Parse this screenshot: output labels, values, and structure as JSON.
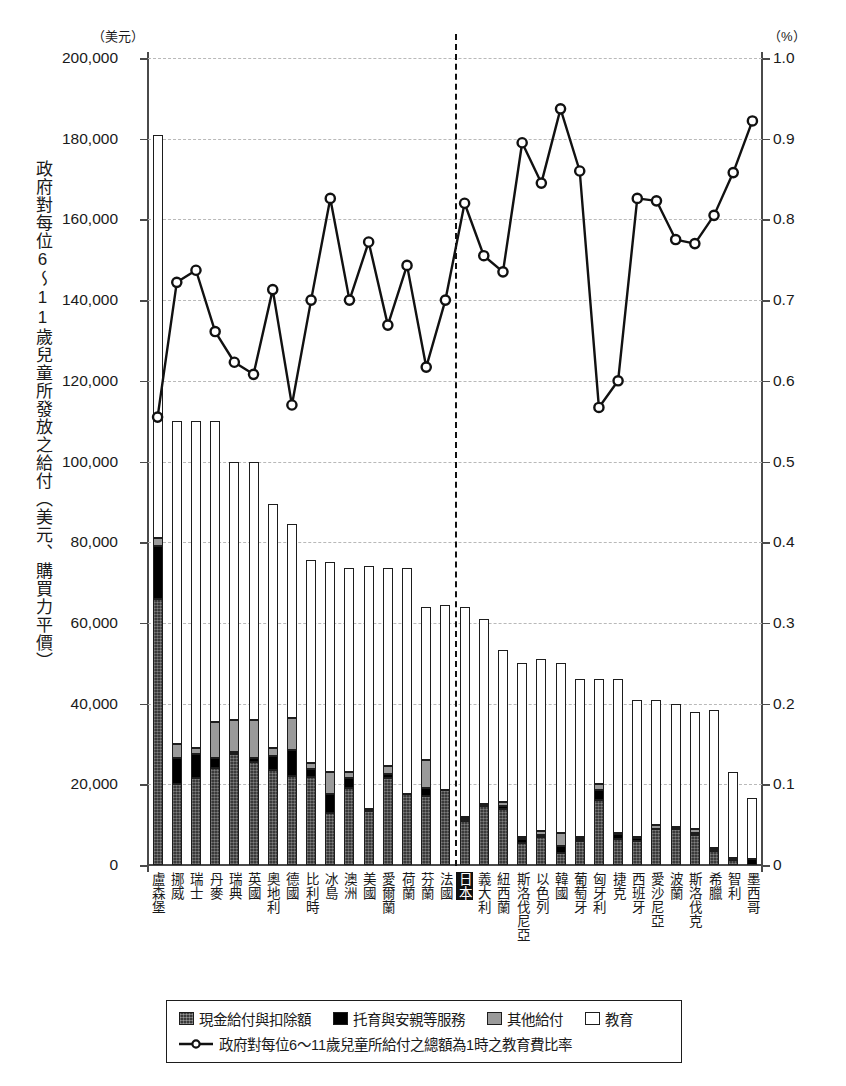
{
  "axes": {
    "left_unit": "（美元）",
    "right_unit": "（%）",
    "y_title": "政府對每位6〜11歲兒童所發放之給付（美元、購買力平價）",
    "left_ticks": [
      "200,000",
      "180,000",
      "160,000",
      "140,000",
      "120,000",
      "100,000",
      "80,000",
      "60,000",
      "40,000",
      "20,000",
      "0"
    ],
    "right_ticks": [
      "1.0",
      "0.9",
      "0.8",
      "0.7",
      "0.6",
      "0.5",
      "0.4",
      "0.3",
      "0.2",
      "0.1",
      "0"
    ]
  },
  "legend": {
    "items": [
      {
        "key": "cash",
        "label": "現金給付與扣除額",
        "color": "#3a3a3a"
      },
      {
        "key": "childcare",
        "label": "托育與安親等服務",
        "color": "#000000"
      },
      {
        "key": "other",
        "label": "其他給付",
        "color": "#9a9a9a"
      },
      {
        "key": "education",
        "label": "教育",
        "color": "#ffffff"
      }
    ],
    "line_label": "政府對每位6〜11歲兒童所給付之總額為1時之教育費比率"
  },
  "highlight_country": "日本",
  "chart_data": {
    "type": "bar",
    "title": "",
    "subtitle": "",
    "xlabel": "",
    "ylabel": "政府對每位6〜11歲兒童所發放之給付（美元、購買力平價）",
    "y2label": "（%）",
    "ylim": [
      0,
      200000
    ],
    "y2lim": [
      0,
      1.0
    ],
    "grid": true,
    "legend_position": "bottom",
    "stacked": true,
    "categories": [
      "盧森堡",
      "挪威",
      "瑞士",
      "丹麥",
      "瑞典",
      "英國",
      "奧地利",
      "德國",
      "比利時",
      "冰島",
      "澳洲",
      "美國",
      "愛爾蘭",
      "荷蘭",
      "芬蘭",
      "法國",
      "日本",
      "義大利",
      "紐西蘭",
      "斯洛伐尼亞",
      "以色列",
      "韓國",
      "葡萄牙",
      "匈牙利",
      "捷克",
      "西班牙",
      "愛沙尼亞",
      "波蘭",
      "斯洛伐克",
      "希臘",
      "智利",
      "墨西哥"
    ],
    "series": [
      {
        "name": "現金給付與扣除額",
        "key": "cash",
        "color": "#3a3a3a",
        "values": [
          66000,
          20000,
          21500,
          24000,
          27500,
          25500,
          23500,
          22000,
          21700,
          13000,
          19000,
          13500,
          21500,
          17500,
          17000,
          18500,
          11000,
          14500,
          14000,
          5500,
          7000,
          3000,
          6000,
          16000,
          6500,
          6000,
          9000,
          9000,
          7500,
          3500,
          1200,
          0
        ]
      },
      {
        "name": "托育與安親等服務",
        "key": "childcare",
        "color": "#000000",
        "values": [
          13000,
          6500,
          6000,
          2500,
          500,
          1000,
          3500,
          6500,
          2000,
          4500,
          2500,
          0,
          1000,
          0,
          2000,
          0,
          500,
          0,
          700,
          900,
          500,
          1800,
          500,
          2500,
          1200,
          800,
          0,
          0,
          500,
          200,
          200,
          1500
        ]
      },
      {
        "name": "其他給付",
        "key": "other",
        "color": "#9a9a9a",
        "values": [
          2000,
          3500,
          1500,
          9000,
          8000,
          9500,
          2000,
          8000,
          1500,
          5500,
          1500,
          500,
          2000,
          0,
          7000,
          0,
          300,
          700,
          1000,
          600,
          1000,
          3200,
          500,
          1500,
          300,
          200,
          800,
          400,
          900,
          500,
          300,
          0
        ]
      },
      {
        "name": "教育",
        "key": "education",
        "color": "#ffffff",
        "values": [
          100000,
          80000,
          81000,
          74500,
          64000,
          64000,
          60500,
          48000,
          50300,
          52000,
          50500,
          60000,
          49000,
          56000,
          38000,
          46000,
          52200,
          45800,
          37500,
          43000,
          42500,
          42000,
          39000,
          26000,
          38000,
          34000,
          31200,
          30600,
          29100,
          34300,
          21300,
          15000
        ]
      }
    ],
    "line_series": {
      "name": "政府對每位6〜11歲兒童所給付之總額為1時之教育費比率",
      "marker": "open-circle",
      "color": "#111111",
      "axis": "right",
      "values": [
        0.555,
        0.722,
        0.737,
        0.661,
        0.623,
        0.608,
        0.713,
        0.57,
        0.7,
        0.826,
        0.7,
        0.772,
        0.669,
        0.743,
        0.617,
        0.7,
        0.82,
        0.755,
        0.735,
        0.895,
        0.845,
        0.937,
        0.86,
        0.567,
        0.6,
        0.826,
        0.823,
        0.775,
        0.77,
        0.805,
        0.858,
        0.922
      ]
    }
  }
}
